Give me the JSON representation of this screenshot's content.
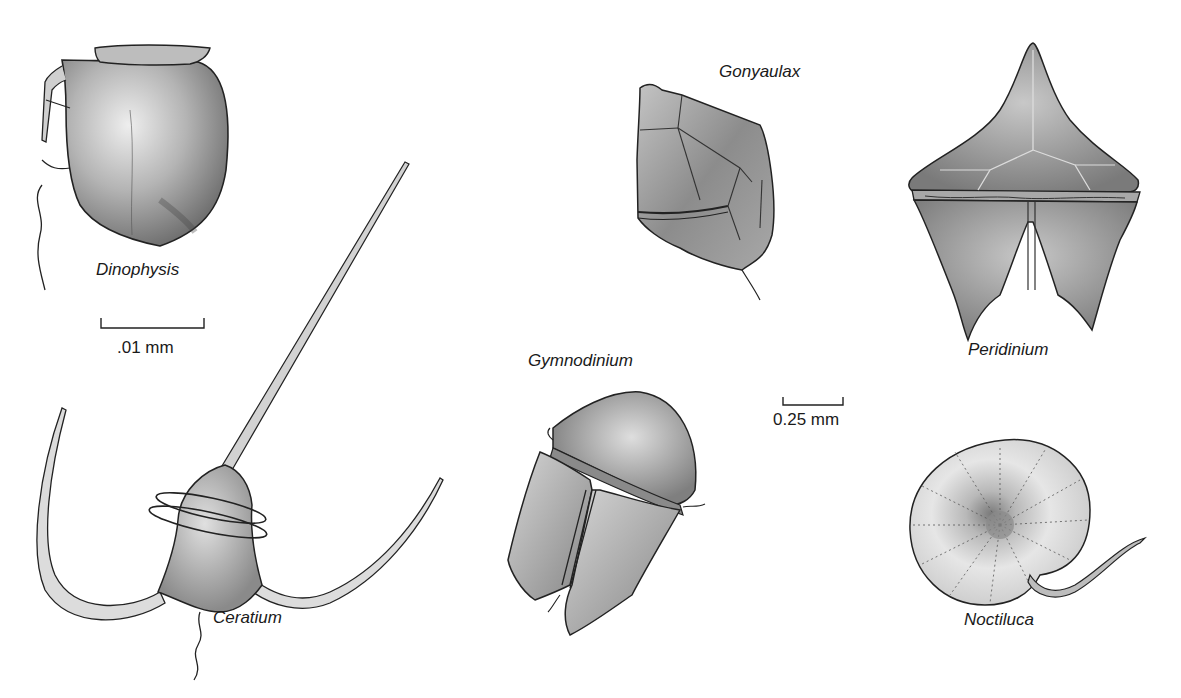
{
  "figure": {
    "organisms": [
      {
        "name": "Dinophysis"
      },
      {
        "name": "Ceratium"
      },
      {
        "name": "Gonyaulax"
      },
      {
        "name": "Gymnodinium"
      },
      {
        "name": "Peridinium"
      },
      {
        "name": "Noctiluca"
      }
    ],
    "scale_bars": [
      {
        "label": ".01 mm",
        "applies_to": "Dinophysis"
      },
      {
        "label": "0.25 mm",
        "applies_to": "Gymnodinium"
      }
    ]
  },
  "colors": {
    "ink": "#1a1a1a",
    "shade_dark": "#6e6e6e",
    "shade_mid": "#9a9a9a",
    "shade_light": "#d0d0d0",
    "background": "#ffffff"
  }
}
